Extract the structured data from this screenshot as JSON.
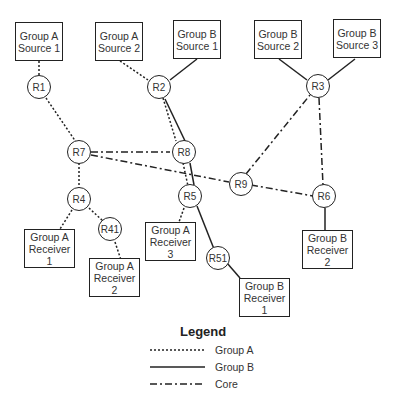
{
  "diagram": {
    "sources": [
      {
        "id": "gas1",
        "line1": "Group A",
        "line2": "Source 1"
      },
      {
        "id": "gas2",
        "line1": "Group A",
        "line2": "Source 2"
      },
      {
        "id": "gbs1",
        "line1": "Group B",
        "line2": "Source 1"
      },
      {
        "id": "gbs2",
        "line1": "Group B",
        "line2": "Source 2"
      },
      {
        "id": "gbs3",
        "line1": "Group B",
        "line2": "Source 3"
      }
    ],
    "receivers": [
      {
        "id": "gar1",
        "line1": "Group A",
        "line2": "Receiver 1"
      },
      {
        "id": "gar2",
        "line1": "Group A",
        "line2": "Receiver 2"
      },
      {
        "id": "gar3",
        "line1": "Group A",
        "line2": "Receiver 3"
      },
      {
        "id": "gbr1",
        "line1": "Group B",
        "line2": "Receiver 1"
      },
      {
        "id": "gbr2",
        "line1": "Group B",
        "line2": "Receiver 2"
      }
    ],
    "routers": [
      "R1",
      "R2",
      "R3",
      "R7",
      "R8",
      "R9",
      "R4",
      "R5",
      "R6",
      "R41",
      "R51"
    ],
    "links": {
      "group_a": [
        [
          "Group A Source 1",
          "R1"
        ],
        [
          "R1",
          "R7"
        ],
        [
          "R7",
          "R4"
        ],
        [
          "R4",
          "Group A Receiver 1"
        ],
        [
          "R4",
          "R41"
        ],
        [
          "R41",
          "Group A Receiver 2"
        ],
        [
          "Group A Source 2",
          "R2"
        ],
        [
          "R2",
          "R8"
        ],
        [
          "R8",
          "R5"
        ],
        [
          "R5",
          "Group A Receiver 3"
        ]
      ],
      "group_b": [
        [
          "Group B Source 1",
          "R2"
        ],
        [
          "R2",
          "R5"
        ],
        [
          "R5",
          "R51"
        ],
        [
          "R51",
          "Group B Receiver 1"
        ],
        [
          "Group B Source 2",
          "R3"
        ],
        [
          "Group B Source 3",
          "R3"
        ],
        [
          "R6",
          "Group B Receiver 2"
        ]
      ],
      "core": [
        [
          "R7",
          "R8"
        ],
        [
          "R7",
          "R9"
        ],
        [
          "R9",
          "R6"
        ],
        [
          "R9",
          "R3"
        ],
        [
          "R3",
          "R6"
        ]
      ]
    }
  },
  "legend": {
    "title": "Legend",
    "items": [
      {
        "label": "Group A",
        "style": "dotted"
      },
      {
        "label": "Group B",
        "style": "solid"
      },
      {
        "label": "Core",
        "style": "dash-dot"
      }
    ]
  }
}
